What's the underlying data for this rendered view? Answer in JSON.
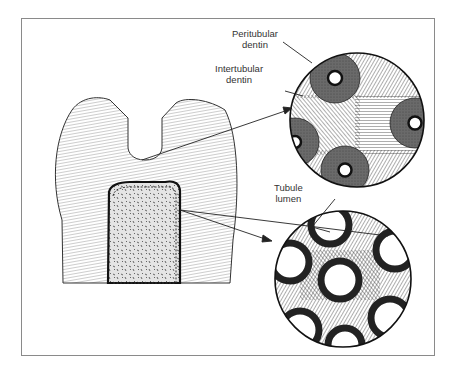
{
  "figure": {
    "labels": {
      "peritubular": {
        "line1": "Peritubular",
        "line2": "dentin"
      },
      "intertubular": {
        "line1": "Intertubular",
        "line2": "dentin"
      },
      "tubule_lumen": {
        "line1": "Tubule",
        "line2": "lumen"
      }
    },
    "panels": [
      {
        "name": "tooth-section",
        "description": "Longitudinal section of tooth showing dentinal tubules and pulp"
      },
      {
        "name": "magnified-crown-dentin",
        "description": "Magnified circle showing peritubular and intertubular dentin"
      },
      {
        "name": "magnified-pulpal-dentin",
        "description": "Magnified circle showing tubule lumens near pulp"
      }
    ],
    "colors": {
      "frame": "#8a8a8a",
      "ink": "#222222",
      "peritubular_fill": "#5a5a5a",
      "background": "#ffffff"
    }
  }
}
